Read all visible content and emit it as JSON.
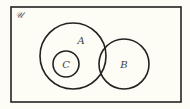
{
  "diagram": {
    "type": "venn",
    "universal_label": "𝒰",
    "background": "#fdfcf5",
    "stroke": "#222222",
    "universe": {
      "x": 11,
      "y": 7,
      "width": 170,
      "height": 95
    },
    "sets": [
      {
        "id": "A",
        "label": "A",
        "cx": 73,
        "cy": 56,
        "r": 33,
        "label_x": 81,
        "label_y": 44
      },
      {
        "id": "B",
        "label": "B",
        "cx": 124,
        "cy": 64,
        "r": 25,
        "label_x": 124,
        "label_y": 68
      },
      {
        "id": "C",
        "label": "C",
        "cx": 66,
        "cy": 64,
        "r": 13,
        "label_x": 66,
        "label_y": 68
      }
    ],
    "relations": [
      "C ⊂ A",
      "A ∩ B ≠ ∅",
      "C ∩ B = ∅"
    ]
  }
}
